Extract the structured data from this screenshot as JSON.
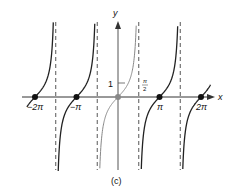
{
  "chart_data": {
    "type": "line",
    "title": "",
    "function": "y = tan x",
    "xlabel": "x",
    "ylabel": "y",
    "caption": "(c)",
    "x_tick_labels": [
      "−2π",
      "−π",
      "π",
      "2π"
    ],
    "x_ticks": [
      -6.2832,
      -3.1416,
      3.1416,
      6.2832
    ],
    "y_tick_labels": [
      "1"
    ],
    "y_ticks": [
      1
    ],
    "annotations": [
      {
        "text": "π/2",
        "x": 1.5708,
        "y": 0.7
      }
    ],
    "asymptotes_x": [
      -4.7124,
      -1.5708,
      1.5708,
      4.7124
    ],
    "marked_points": [
      {
        "x": -6.2832,
        "y": 0,
        "label": "−2π"
      },
      {
        "x": -3.1416,
        "y": 0,
        "label": "−π"
      },
      {
        "x": 0,
        "y": 0,
        "label": ""
      },
      {
        "x": 3.1416,
        "y": 0,
        "label": "π"
      },
      {
        "x": 6.2832,
        "y": 0,
        "label": "2π"
      }
    ],
    "branches": [
      {
        "name": "branch-left-2",
        "x_range": [
          -6.9,
          -4.75
        ],
        "color": "#222222"
      },
      {
        "name": "branch-left-1",
        "x_range": [
          -4.6,
          -1.61
        ],
        "color": "#222222"
      },
      {
        "name": "branch-center",
        "x_range": [
          -1.53,
          1.53
        ],
        "color": "#888888"
      },
      {
        "name": "branch-right-1",
        "x_range": [
          1.61,
          4.67
        ],
        "color": "#222222"
      },
      {
        "name": "branch-right-2",
        "x_range": [
          4.75,
          7.0
        ],
        "color": "#222222"
      }
    ],
    "xlim": [
      -7.2,
      7.6
    ],
    "ylim": [
      -5.1,
      5.4
    ],
    "grid": false,
    "legend": null
  },
  "labels": {
    "y_axis": "y",
    "x_axis": "x",
    "one": "1",
    "pi_half_num": "π",
    "pi_half_den": "2",
    "neg_two_pi": "−2π",
    "neg_pi": "−π",
    "pi": "π",
    "two_pi": "2π",
    "caption": "(c)"
  },
  "colors": {
    "axis": "#333333",
    "curve": "#222222",
    "center_curve": "#8a8a8a",
    "asymptote": "#444444",
    "point": "#111111",
    "origin_point": "#888888"
  }
}
